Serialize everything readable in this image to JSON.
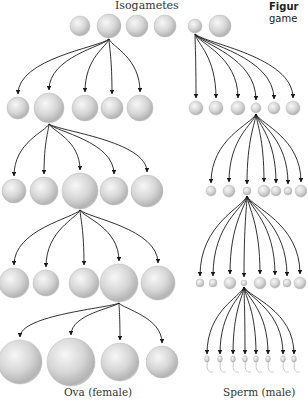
{
  "title": "Isogametes",
  "caption": {
    "bold": "Figur",
    "line2": "game"
  },
  "labels": {
    "female": "Ova (female)",
    "male": "Sperm (male)"
  },
  "colors": {
    "sphere_light": "#f4f4f4",
    "sphere_mid": "#c9c9c9",
    "sphere_dark": "#9a9a9a",
    "arrow": "#1a1a1a",
    "text": "#333333"
  },
  "isogametes": [
    {
      "x": 80,
      "y": 26,
      "r": 10
    },
    {
      "x": 109,
      "y": 26,
      "r": 12
    },
    {
      "x": 137,
      "y": 26,
      "r": 11
    },
    {
      "x": 165,
      "y": 26,
      "r": 11
    },
    {
      "x": 195,
      "y": 26,
      "r": 7
    },
    {
      "x": 220,
      "y": 26,
      "r": 11
    }
  ],
  "female_rows": [
    {
      "source": {
        "x": 109,
        "y": 39
      },
      "cells": [
        {
          "x": 18,
          "y": 108,
          "r": 11
        },
        {
          "x": 49,
          "y": 108,
          "r": 15
        },
        {
          "x": 85,
          "y": 108,
          "r": 13
        },
        {
          "x": 112,
          "y": 108,
          "r": 11
        },
        {
          "x": 140,
          "y": 108,
          "r": 13
        }
      ]
    },
    {
      "source": {
        "x": 49,
        "y": 124
      },
      "cells": [
        {
          "x": 14,
          "y": 191,
          "r": 12
        },
        {
          "x": 44,
          "y": 191,
          "r": 14
        },
        {
          "x": 80,
          "y": 191,
          "r": 18
        },
        {
          "x": 114,
          "y": 191,
          "r": 14
        },
        {
          "x": 147,
          "y": 191,
          "r": 16
        }
      ]
    },
    {
      "source": {
        "x": 80,
        "y": 210
      },
      "cells": [
        {
          "x": 14,
          "y": 283,
          "r": 15
        },
        {
          "x": 46,
          "y": 283,
          "r": 13
        },
        {
          "x": 84,
          "y": 283,
          "r": 15
        },
        {
          "x": 119,
          "y": 283,
          "r": 19
        },
        {
          "x": 158,
          "y": 283,
          "r": 17
        }
      ]
    },
    {
      "source": {
        "x": 119,
        "y": 303
      },
      "cells": [
        {
          "x": 20,
          "y": 362,
          "r": 22
        },
        {
          "x": 71,
          "y": 362,
          "r": 24
        },
        {
          "x": 120,
          "y": 362,
          "r": 19
        },
        {
          "x": 162,
          "y": 362,
          "r": 16
        }
      ]
    }
  ],
  "male_rows": [
    {
      "source": {
        "x": 195,
        "y": 34
      },
      "cells": [
        {
          "x": 196,
          "y": 108,
          "r": 7
        },
        {
          "x": 216,
          "y": 108,
          "r": 7
        },
        {
          "x": 238,
          "y": 108,
          "r": 7
        },
        {
          "x": 256,
          "y": 108,
          "r": 5
        },
        {
          "x": 274,
          "y": 108,
          "r": 6
        },
        {
          "x": 293,
          "y": 108,
          "r": 7
        }
      ]
    },
    {
      "source": {
        "x": 256,
        "y": 114
      },
      "cells": [
        {
          "x": 211,
          "y": 191,
          "r": 5
        },
        {
          "x": 229,
          "y": 191,
          "r": 6
        },
        {
          "x": 247,
          "y": 191,
          "r": 4
        },
        {
          "x": 264,
          "y": 191,
          "r": 6
        },
        {
          "x": 276,
          "y": 191,
          "r": 5
        },
        {
          "x": 288,
          "y": 191,
          "r": 4
        },
        {
          "x": 301,
          "y": 191,
          "r": 6
        }
      ]
    },
    {
      "source": {
        "x": 247,
        "y": 196
      },
      "cells": [
        {
          "x": 200,
          "y": 283,
          "r": 4
        },
        {
          "x": 213,
          "y": 283,
          "r": 4
        },
        {
          "x": 230,
          "y": 283,
          "r": 6
        },
        {
          "x": 244,
          "y": 283,
          "r": 3
        },
        {
          "x": 260,
          "y": 283,
          "r": 6
        },
        {
          "x": 275,
          "y": 283,
          "r": 5
        },
        {
          "x": 287,
          "y": 283,
          "r": 4
        },
        {
          "x": 300,
          "y": 283,
          "r": 6
        }
      ]
    },
    {
      "source": {
        "x": 244,
        "y": 287
      },
      "sperm": true,
      "cells": [
        {
          "x": 207,
          "y": 361
        },
        {
          "x": 220,
          "y": 361
        },
        {
          "x": 233,
          "y": 361
        },
        {
          "x": 245,
          "y": 361
        },
        {
          "x": 256,
          "y": 361
        },
        {
          "x": 268,
          "y": 361
        },
        {
          "x": 283,
          "y": 361
        },
        {
          "x": 294,
          "y": 361
        }
      ]
    }
  ]
}
